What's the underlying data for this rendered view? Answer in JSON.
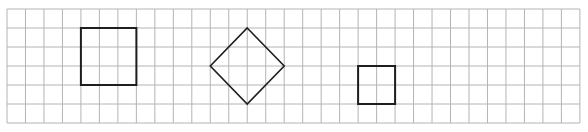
{
  "grid": {
    "origin_x": 7,
    "origin_y": 9,
    "cell_w": 18.48,
    "cell_h": 19,
    "cols": 31,
    "rows": 6,
    "line_color": "#b4b4b4",
    "line_width": 1
  },
  "shapes": [
    {
      "name": "large-square",
      "type": "polygon",
      "points_grid": [
        [
          4,
          1
        ],
        [
          7,
          1
        ],
        [
          7,
          4
        ],
        [
          4,
          4
        ]
      ],
      "stroke": "#1e1e1e",
      "stroke_width": 2
    },
    {
      "name": "diamond",
      "type": "polygon",
      "points_grid": [
        [
          13,
          1
        ],
        [
          15,
          3
        ],
        [
          13,
          5
        ],
        [
          11,
          3
        ]
      ],
      "stroke": "#1e1e1e",
      "stroke_width": 1.6
    },
    {
      "name": "small-square",
      "type": "polygon",
      "points_grid": [
        [
          19,
          3
        ],
        [
          21,
          3
        ],
        [
          21,
          5
        ],
        [
          19,
          5
        ]
      ],
      "stroke": "#1e1e1e",
      "stroke_width": 2
    }
  ]
}
